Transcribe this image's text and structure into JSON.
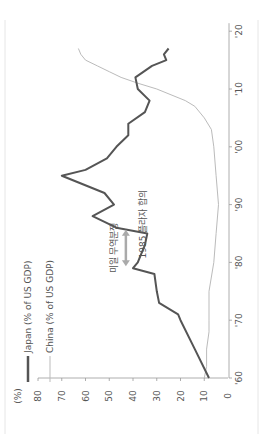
{
  "chart_data": {
    "type": "line",
    "orientation": "rotated-90-ccw",
    "title": "",
    "unit_label": "(%)",
    "xlabel": "",
    "ylabel": "(%)",
    "ylim": [
      0,
      80
    ],
    "xlim": [
      1960,
      2020
    ],
    "y_ticks": [
      0,
      10,
      20,
      30,
      40,
      50,
      60,
      70,
      80
    ],
    "x_ticks": [
      "'60",
      "'70",
      "'80",
      "'90",
      "'00",
      "'10",
      "'20"
    ],
    "x_tick_values": [
      1960,
      1970,
      1980,
      1990,
      2000,
      2010,
      2020
    ],
    "grid": false,
    "legend_position": "top-left (rotated)",
    "series": [
      {
        "name": "Japan (% of US GDP)",
        "color": "#555555",
        "width": 2,
        "x": [
          1960,
          1965,
          1970,
          1971,
          1973,
          1975,
          1978,
          1979,
          1980,
          1981,
          1983,
          1985,
          1986,
          1987,
          1988,
          1990,
          1992,
          1995,
          1996,
          1998,
          2000,
          2002,
          2004,
          2006,
          2008,
          2010,
          2012,
          2014,
          2015,
          2016,
          2017
        ],
        "values": [
          8,
          14,
          20,
          21,
          29,
          30,
          31,
          40,
          38,
          37,
          35,
          34,
          47,
          52,
          57,
          48,
          52,
          70,
          60,
          51,
          47,
          42,
          42,
          35,
          33,
          38,
          39,
          32,
          26,
          27,
          25
        ]
      },
      {
        "name": "China (% of US GDP)",
        "color": "#bbbbbb",
        "width": 1,
        "x": [
          1960,
          1962,
          1965,
          1968,
          1970,
          1975,
          1980,
          1985,
          1990,
          1995,
          2000,
          2003,
          2005,
          2007,
          2008,
          2009,
          2010,
          2011,
          2012,
          2013,
          2014,
          2015,
          2016,
          2017
        ],
        "values": [
          10,
          9,
          9,
          8,
          8,
          8,
          6,
          5,
          4,
          5,
          6,
          7,
          10,
          14,
          18,
          24,
          30,
          38,
          45,
          50,
          55,
          60,
          62,
          63
        ]
      }
    ],
    "annotations": [
      {
        "text": "미일 무역분쟁",
        "type": "double-arrow",
        "from_year": 1979,
        "to_year": 1986,
        "value": 43
      },
      {
        "text": "1985 플라자 합의",
        "type": "label",
        "year": 1988,
        "value": 30
      }
    ]
  },
  "legend": {
    "japan": "Japan (% of US GDP)",
    "china": "China (% of US GDP)"
  },
  "axis": {
    "unit": "(%)",
    "value_ticks": [
      "80",
      "70",
      "60",
      "50",
      "40",
      "30",
      "20",
      "10",
      "0"
    ],
    "year_ticks": [
      "'60",
      "'70",
      "'80",
      "'90",
      "'00",
      "'10",
      "'20"
    ]
  },
  "annotations": {
    "trade_dispute": "미일 무역분쟁",
    "plaza_accord": "1985 플라자 합의"
  }
}
